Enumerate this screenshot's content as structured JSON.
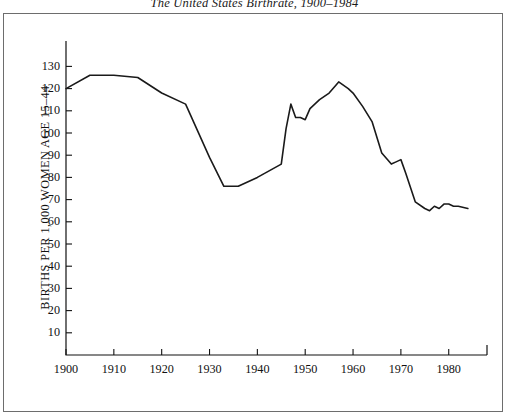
{
  "chart_data": {
    "type": "line",
    "title": "The United States Birthrate, 1900–1984",
    "xlabel": "",
    "ylabel": "BIRTHS PER 1,000 WOMEN AGE 15–44",
    "xlim": [
      1900,
      1988
    ],
    "ylim": [
      0,
      134
    ],
    "grid": false,
    "legend": null,
    "x_ticks": [
      "1900",
      "1910",
      "1920",
      "1930",
      "1940",
      "1950",
      "1960",
      "1970",
      "1980"
    ],
    "x_tick_values": [
      1900,
      1910,
      1920,
      1930,
      1940,
      1950,
      1960,
      1970,
      1980
    ],
    "y_ticks": [
      "10",
      "20",
      "30",
      "40",
      "50",
      "60",
      "70",
      "80",
      "90",
      "100",
      "110",
      "120",
      "130"
    ],
    "y_tick_values": [
      10,
      20,
      30,
      40,
      50,
      60,
      70,
      80,
      90,
      100,
      110,
      120,
      130
    ],
    "series": [
      {
        "name": "US Birthrate",
        "color": "#1a1a1a",
        "x": [
          1900,
          1905,
          1910,
          1915,
          1920,
          1925,
          1930,
          1933,
          1936,
          1940,
          1945,
          1946,
          1947,
          1948,
          1949,
          1950,
          1951,
          1953,
          1955,
          1957,
          1959,
          1960,
          1962,
          1964,
          1966,
          1968,
          1969,
          1970,
          1971,
          1973,
          1975,
          1976,
          1977,
          1978,
          1979,
          1980,
          1981,
          1982,
          1984
        ],
        "y": [
          120,
          126,
          126,
          125,
          118,
          113,
          89,
          76,
          76,
          80,
          86,
          102,
          113,
          107,
          107,
          106,
          111,
          115,
          118,
          123,
          120,
          118,
          112,
          105,
          91,
          86,
          87,
          88,
          82,
          69,
          66,
          65,
          67,
          66,
          68,
          68,
          67,
          67,
          66
        ]
      }
    ]
  }
}
